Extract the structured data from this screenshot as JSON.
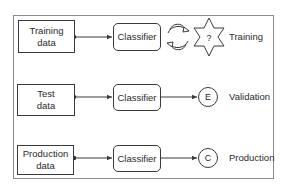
{
  "diagram": {
    "rows": [
      {
        "source": {
          "line1": "Training",
          "line2": "data"
        },
        "process": "Classifier",
        "outcome_icon": "cycle-arrows-and-star-question",
        "star_symbol": "?",
        "stage": "Training"
      },
      {
        "source": {
          "line1": "Test",
          "line2": "data"
        },
        "process": "Classifier",
        "outcome_icon": "circle-letter",
        "outcome_symbol": "E",
        "stage": "Validation"
      },
      {
        "source": {
          "line1": "Production",
          "line2": "data"
        },
        "process": "Classifier",
        "outcome_icon": "circle-letter",
        "outcome_symbol": "C",
        "stage": "Production"
      }
    ],
    "colors": {
      "stroke": "#3a3a3a",
      "frame": "#8a8a8a",
      "background": "#ffffff"
    }
  }
}
